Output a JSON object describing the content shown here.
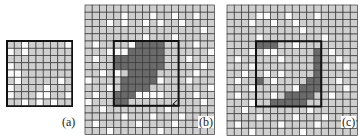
{
  "colors": {
    "light": "#cfcfcf",
    "white": "#fafafa",
    "dark": "#6a6a6a",
    "grid_line": "#3a3a3a",
    "box_line": "#111111"
  },
  "panels": [
    {
      "id": "a",
      "label": "(a)",
      "x": 6,
      "y": 40,
      "cols": 9,
      "rows": 9,
      "cell": 7.25,
      "label_pos": {
        "x": 61,
        "y": 116
      },
      "white": [
        [
          0,
          2
        ],
        [
          0,
          8
        ],
        [
          1,
          0
        ],
        [
          1,
          2
        ],
        [
          3,
          0
        ],
        [
          4,
          0
        ],
        [
          4,
          1
        ],
        [
          5,
          1
        ],
        [
          5,
          7
        ],
        [
          6,
          0
        ],
        [
          6,
          5
        ],
        [
          7,
          0
        ],
        [
          7,
          4
        ],
        [
          7,
          5
        ],
        [
          7,
          8
        ],
        [
          8,
          2
        ],
        [
          8,
          4
        ],
        [
          8,
          6
        ]
      ],
      "dark": [],
      "box": {
        "col": 0,
        "row": 0,
        "cols": 9,
        "rows": 9
      },
      "mark": null
    },
    {
      "id": "b",
      "label": "(b)",
      "x": 84,
      "y": 4,
      "cols": 18,
      "rows": 18,
      "cell": 7.2,
      "label_pos": {
        "x": 198,
        "y": 116
      },
      "white": [
        [
          1,
          5
        ],
        [
          1,
          9
        ],
        [
          1,
          12
        ],
        [
          1,
          15
        ],
        [
          2,
          3
        ],
        [
          2,
          5
        ],
        [
          2,
          8
        ],
        [
          2,
          10
        ],
        [
          2,
          13
        ],
        [
          3,
          16
        ],
        [
          4,
          8
        ],
        [
          4,
          12
        ],
        [
          5,
          1
        ],
        [
          5,
          15
        ],
        [
          6,
          3
        ],
        [
          6,
          6
        ],
        [
          6,
          17
        ],
        [
          7,
          1
        ],
        [
          7,
          14
        ],
        [
          8,
          4
        ],
        [
          8,
          16
        ],
        [
          9,
          2
        ],
        [
          9,
          15
        ],
        [
          10,
          0
        ],
        [
          10,
          14
        ],
        [
          11,
          3
        ],
        [
          11,
          17
        ],
        [
          12,
          1
        ],
        [
          12,
          15
        ],
        [
          13,
          0
        ],
        [
          13,
          16
        ],
        [
          14,
          2
        ],
        [
          14,
          11
        ],
        [
          15,
          5
        ],
        [
          15,
          9
        ],
        [
          15,
          13
        ],
        [
          16,
          1
        ],
        [
          16,
          7
        ],
        [
          16,
          12
        ],
        [
          17,
          3
        ],
        [
          17,
          10
        ],
        [
          5,
          6
        ],
        [
          5,
          7
        ],
        [
          5,
          8
        ],
        [
          6,
          4
        ],
        [
          6,
          5
        ],
        [
          9,
          4
        ],
        [
          10,
          5
        ],
        [
          10,
          10
        ],
        [
          11,
          8
        ],
        [
          12,
          7
        ],
        [
          12,
          8
        ],
        [
          12,
          9
        ],
        [
          12,
          10
        ]
      ],
      "dark": [
        [
          5,
          7
        ],
        [
          5,
          8
        ],
        [
          5,
          9
        ],
        [
          5,
          10
        ],
        [
          6,
          6
        ],
        [
          6,
          7
        ],
        [
          6,
          8
        ],
        [
          6,
          9
        ],
        [
          6,
          10
        ],
        [
          7,
          4
        ],
        [
          7,
          5
        ],
        [
          7,
          6
        ],
        [
          7,
          7
        ],
        [
          7,
          8
        ],
        [
          7,
          9
        ],
        [
          7,
          10
        ],
        [
          8,
          4
        ],
        [
          8,
          5
        ],
        [
          8,
          6
        ],
        [
          8,
          7
        ],
        [
          8,
          8
        ],
        [
          8,
          9
        ],
        [
          8,
          10
        ],
        [
          9,
          6
        ],
        [
          9,
          7
        ],
        [
          9,
          8
        ],
        [
          9,
          9
        ],
        [
          10,
          5
        ],
        [
          10,
          6
        ],
        [
          10,
          7
        ],
        [
          10,
          8
        ],
        [
          10,
          9
        ],
        [
          11,
          5
        ],
        [
          11,
          6
        ],
        [
          11,
          7
        ],
        [
          11,
          8
        ],
        [
          12,
          4
        ],
        [
          12,
          5
        ],
        [
          12,
          6
        ],
        [
          13,
          4
        ],
        [
          13,
          5
        ]
      ],
      "box": {
        "col": 4,
        "row": 5,
        "cols": 9,
        "rows": 9
      },
      "mark": {
        "col": 12,
        "row": 13
      }
    },
    {
      "id": "c",
      "label": "(c)",
      "x": 226,
      "y": 4,
      "cols": 18,
      "rows": 18,
      "cell": 7.25,
      "label_pos": {
        "x": 341,
        "y": 116
      },
      "white": [
        [
          1,
          4
        ],
        [
          1,
          5
        ],
        [
          1,
          8
        ],
        [
          1,
          12
        ],
        [
          2,
          3
        ],
        [
          2,
          6
        ],
        [
          2,
          9
        ],
        [
          3,
          10
        ],
        [
          4,
          4
        ],
        [
          4,
          13
        ],
        [
          5,
          6
        ],
        [
          5,
          9
        ],
        [
          6,
          3
        ],
        [
          6,
          5
        ],
        [
          6,
          14
        ],
        [
          7,
          1
        ],
        [
          7,
          15
        ],
        [
          8,
          3
        ],
        [
          8,
          16
        ],
        [
          9,
          2
        ],
        [
          9,
          7
        ],
        [
          10,
          1
        ],
        [
          10,
          15
        ],
        [
          11,
          3
        ],
        [
          11,
          16
        ],
        [
          12,
          1
        ],
        [
          12,
          6
        ],
        [
          12,
          14
        ],
        [
          13,
          3
        ],
        [
          13,
          8
        ],
        [
          14,
          2
        ],
        [
          14,
          11
        ],
        [
          15,
          4
        ],
        [
          15,
          9
        ],
        [
          15,
          13
        ],
        [
          16,
          1
        ],
        [
          16,
          7
        ],
        [
          16,
          12
        ],
        [
          17,
          3
        ],
        [
          17,
          10
        ],
        [
          6,
          6
        ],
        [
          7,
          7
        ],
        [
          9,
          5
        ],
        [
          10,
          6
        ],
        [
          11,
          9
        ],
        [
          12,
          10
        ]
      ],
      "dark": [
        [
          5,
          4
        ],
        [
          5,
          5
        ],
        [
          5,
          6
        ],
        [
          6,
          12
        ],
        [
          7,
          12
        ],
        [
          8,
          12
        ],
        [
          9,
          12
        ],
        [
          10,
          4
        ],
        [
          10,
          11
        ],
        [
          10,
          12
        ],
        [
          11,
          10
        ],
        [
          11,
          11
        ],
        [
          11,
          12
        ],
        [
          12,
          8
        ],
        [
          12,
          9
        ],
        [
          12,
          10
        ],
        [
          12,
          11
        ],
        [
          13,
          6
        ],
        [
          13,
          7
        ],
        [
          13,
          8
        ],
        [
          13,
          9
        ],
        [
          13,
          10
        ]
      ],
      "box": {
        "col": 4,
        "row": 5,
        "cols": 9,
        "rows": 9
      },
      "mark": null
    }
  ]
}
